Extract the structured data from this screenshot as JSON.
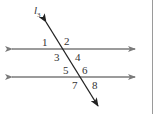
{
  "diagram": {
    "transversal_label": "l",
    "transversal_subscript": "3",
    "angle_labels": [
      "1",
      "2",
      "3",
      "4",
      "5",
      "6",
      "7",
      "8"
    ],
    "colors": {
      "parallel_lines": "#7a7a7a",
      "transversal": "#222222",
      "label": "#333333",
      "border": "#9a9a9a"
    }
  }
}
